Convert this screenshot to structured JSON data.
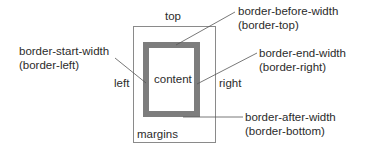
{
  "diagram": {
    "title": "",
    "colors": {
      "background": "#ffffff",
      "margin_box_stroke": "#8a8a8a",
      "border_fill": "#7d7d7d",
      "leader_line": "#555555",
      "text": "#2b2b2b"
    },
    "margin_box": {
      "label": "margins",
      "x": 133,
      "y": 26,
      "width": 82,
      "height": 116
    },
    "border_box": {
      "x": 143,
      "y": 42,
      "width": 57,
      "height": 75,
      "thickness": 6
    },
    "content": {
      "label": "content"
    },
    "sides": {
      "top": "top",
      "left": "left",
      "right": "right"
    },
    "callouts": [
      {
        "id": "border-start",
        "line1": "border-start-width",
        "line2": "(border-left)",
        "leader": {
          "x1": 115,
          "y1": 58,
          "x2": 146,
          "y2": 83
        }
      },
      {
        "id": "border-before",
        "line1": "border-before-width",
        "line2": "(border-top)",
        "leader": {
          "x1": 235,
          "y1": 12,
          "x2": 176,
          "y2": 45
        }
      },
      {
        "id": "border-end",
        "line1": "border-end-width",
        "line2": "(border-right)",
        "leader": {
          "x1": 257,
          "y1": 53,
          "x2": 197,
          "y2": 84
        }
      },
      {
        "id": "border-after",
        "line1": "border-after-width",
        "line2": "(border-bottom)",
        "leader": {
          "x1": 183,
          "y1": 117,
          "x2": 243,
          "y2": 117
        }
      }
    ]
  }
}
